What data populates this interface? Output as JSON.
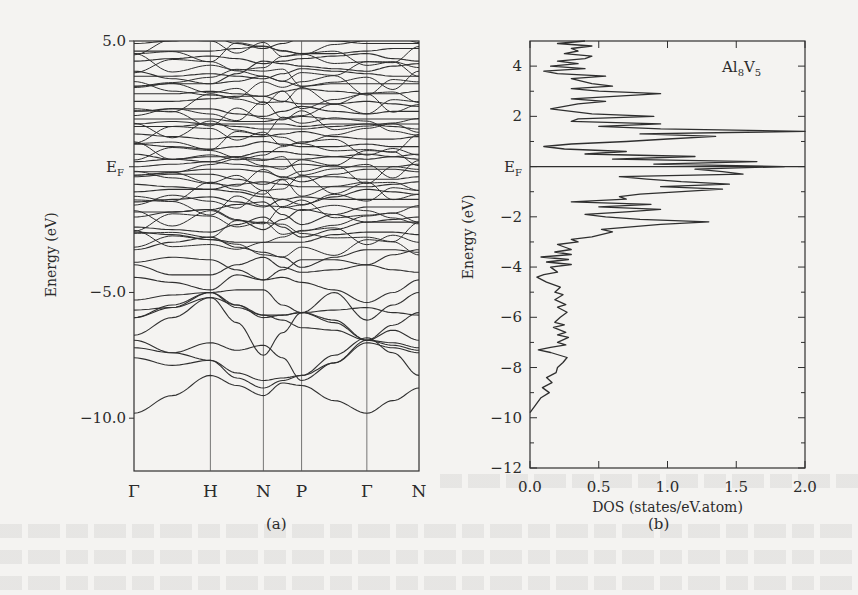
{
  "figure": {
    "panel_a_label": "(a)",
    "panel_b_label": "(b)"
  },
  "chart_data": [
    {
      "type": "line",
      "title": "Band structure",
      "panel": "(a)",
      "xlabel": "",
      "ylabel": "Energy (eV)",
      "ylim": [
        -12.1,
        5.0
      ],
      "yticks": [
        {
          "value": 5.0,
          "label": "5.0"
        },
        {
          "value": 0.0,
          "label": "EF"
        },
        {
          "value": -5.0,
          "label": "-5.0"
        },
        {
          "value": -10.0,
          "label": "-10.0"
        }
      ],
      "x_kpoints": [
        {
          "label": "Γ",
          "pos": 0.0
        },
        {
          "label": "H",
          "pos": 0.268
        },
        {
          "label": "N",
          "pos": 0.454
        },
        {
          "label": "P",
          "pos": 0.588
        },
        {
          "label": "Γ",
          "pos": 0.817
        },
        {
          "label": "N",
          "pos": 1.0
        }
      ],
      "fermi_label": "E",
      "fermi_sub": "F",
      "lowest_band": {
        "x": [
          0.0,
          0.268,
          0.454,
          0.588,
          0.817,
          1.0
        ],
        "y": [
          -9.8,
          -8.3,
          -9.1,
          -8.7,
          -9.8,
          -8.8
        ]
      }
    },
    {
      "type": "line",
      "title": "Density of states",
      "panel": "(b)",
      "annotation": "Al8V5",
      "annotation_main": "Al",
      "annotation_sub1": "8",
      "annotation_v": "V",
      "annotation_sub2": "5",
      "xlabel": "DOS (states/eV.atom)",
      "ylabel": "Energy (eV)",
      "xlim": [
        0.0,
        2.0
      ],
      "ylim": [
        -12,
        5
      ],
      "xticks": [
        "0.0",
        "0.5",
        "1.0",
        "1.5",
        "2.0"
      ],
      "yticks": [
        {
          "value": 4,
          "label": "4"
        },
        {
          "value": 2,
          "label": "2"
        },
        {
          "value": 0,
          "label": "EF"
        },
        {
          "value": -2,
          "label": "-2"
        },
        {
          "value": -4,
          "label": "-4"
        },
        {
          "value": -6,
          "label": "-6"
        },
        {
          "value": -8,
          "label": "-8"
        },
        {
          "value": -10,
          "label": "-10"
        },
        {
          "value": -12,
          "label": "-12"
        }
      ],
      "fermi_line": 0,
      "energy": [
        -9.8,
        -9.5,
        -9.2,
        -9.0,
        -8.8,
        -8.6,
        -8.4,
        -8.2,
        -8.0,
        -7.8,
        -7.6,
        -7.4,
        -7.3,
        -7.2,
        -7.1,
        -7.0,
        -6.8,
        -6.7,
        -6.6,
        -6.4,
        -6.3,
        -6.2,
        -6.0,
        -5.8,
        -5.6,
        -5.5,
        -5.3,
        -5.1,
        -5.0,
        -4.8,
        -4.6,
        -4.4,
        -4.3,
        -4.2,
        -4.0,
        -3.9,
        -3.8,
        -3.7,
        -3.6,
        -3.5,
        -3.4,
        -3.3,
        -3.1,
        -3.0,
        -2.9,
        -2.8,
        -2.6,
        -2.5,
        -2.3,
        -2.2,
        -2.1,
        -2.0,
        -1.9,
        -1.8,
        -1.7,
        -1.6,
        -1.5,
        -1.4,
        -1.3,
        -1.2,
        -1.1,
        -1.0,
        -0.9,
        -0.8,
        -0.7,
        -0.6,
        -0.5,
        -0.4,
        -0.3,
        -0.2,
        -0.1,
        0.0,
        0.1,
        0.2,
        0.3,
        0.4,
        0.5,
        0.6,
        0.7,
        0.8,
        0.9,
        1.0,
        1.1,
        1.2,
        1.3,
        1.4,
        1.5,
        1.6,
        1.7,
        1.8,
        1.9,
        2.0,
        2.1,
        2.2,
        2.3,
        2.5,
        2.6,
        2.7,
        2.9,
        3.0,
        3.1,
        3.2,
        3.3,
        3.5,
        3.6,
        3.7,
        3.8,
        3.9,
        4.0,
        4.1,
        4.2,
        4.3,
        4.4,
        4.5,
        4.6,
        4.7,
        4.8,
        4.9,
        5.0
      ],
      "dos": [
        0.0,
        0.04,
        0.08,
        0.14,
        0.09,
        0.16,
        0.12,
        0.19,
        0.2,
        0.24,
        0.27,
        0.15,
        0.06,
        0.15,
        0.26,
        0.2,
        0.28,
        0.2,
        0.26,
        0.17,
        0.25,
        0.18,
        0.22,
        0.27,
        0.2,
        0.26,
        0.18,
        0.24,
        0.18,
        0.22,
        0.12,
        0.05,
        0.1,
        0.2,
        0.15,
        0.3,
        0.12,
        0.28,
        0.08,
        0.3,
        0.18,
        0.3,
        0.2,
        0.35,
        0.3,
        0.45,
        0.6,
        0.52,
        0.95,
        1.3,
        0.8,
        0.55,
        0.4,
        0.7,
        0.95,
        0.5,
        0.88,
        0.3,
        0.7,
        0.65,
        0.8,
        1.1,
        1.4,
        0.95,
        1.45,
        1.1,
        0.85,
        0.65,
        1.55,
        1.4,
        1.2,
        1.85,
        0.9,
        1.65,
        0.6,
        1.2,
        0.4,
        0.7,
        0.25,
        0.1,
        0.3,
        0.7,
        1.0,
        1.35,
        0.8,
        2.0,
        0.95,
        0.5,
        0.95,
        0.3,
        0.35,
        0.9,
        0.45,
        0.3,
        0.15,
        0.35,
        0.55,
        0.3,
        0.95,
        0.5,
        0.3,
        0.6,
        0.45,
        0.3,
        0.55,
        0.2,
        0.1,
        0.4,
        0.15,
        0.35,
        0.2,
        0.4,
        0.45,
        0.25,
        0.35,
        0.3,
        0.45,
        0.2,
        0.4,
        0.5
      ]
    }
  ]
}
